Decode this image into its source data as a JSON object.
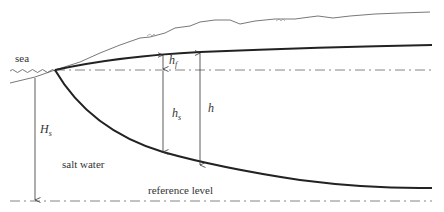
{
  "diagram": {
    "type": "coastal-aquifer-freshwater-lens-cross-section",
    "labels": {
      "sea": "sea",
      "salt_water": "salt water",
      "reference_level": "reference level",
      "H_s_main": "H",
      "H_s_sub": "s",
      "h_f_main": "h",
      "h_f_sub": "f",
      "h_s_main": "h",
      "h_s_sub": "s",
      "h": "h"
    },
    "elements": [
      "ground-surface",
      "water-table",
      "sea-level-line",
      "fresh-salt-interface",
      "reference-level-line",
      "H_s-dimension-arrow",
      "h_f-dimension-arrow",
      "h_s-dimension-arrow",
      "h-dimension-arrow"
    ],
    "colors": {
      "line": "#222222",
      "thin_line": "#555555",
      "dash_line": "#666666",
      "text": "#333333",
      "background": "#ffffff"
    }
  }
}
